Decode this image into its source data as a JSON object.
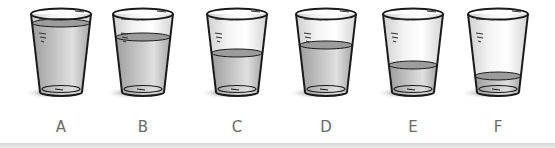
{
  "figure": {
    "glasses": [
      {
        "label": "A",
        "fill_level": "nearly full",
        "water_top_y": 23,
        "left": 21
      },
      {
        "label": "B",
        "fill_level": "about three-quarters",
        "water_top_y": 37,
        "left": 103
      },
      {
        "label": "C",
        "fill_level": "about half",
        "water_top_y": 53,
        "left": 197
      },
      {
        "label": "D",
        "fill_level": "about two-thirds",
        "water_top_y": 45,
        "left": 286
      },
      {
        "label": "E",
        "fill_level": "about one-third",
        "water_top_y": 65,
        "left": 373
      },
      {
        "label": "F",
        "fill_level": "nearly empty",
        "water_top_y": 76,
        "left": 458
      }
    ]
  },
  "colors": {
    "outline": "#1a1a1a",
    "water": "#b9b9b9",
    "water_surface": "#9c9c9c",
    "glass_highlight": "#f4f4f4",
    "shadow": "#8a8a8a",
    "label": "#6a6a6a"
  }
}
